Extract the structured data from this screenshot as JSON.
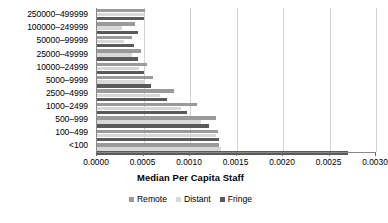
{
  "chart_data": {
    "type": "bar",
    "orientation": "horizontal",
    "title": "",
    "xlabel": "Median Per Capita Staff",
    "ylabel": "",
    "xlim": [
      0.0,
      0.003
    ],
    "xticks": [
      "0.0000",
      "0.0005",
      "0.0010",
      "0.0015",
      "0.0020",
      "0.0025",
      "0.0030"
    ],
    "xtick_values": [
      0.0,
      0.0005,
      0.001,
      0.0015,
      0.002,
      0.0025,
      0.003
    ],
    "grid": true,
    "grid_axis": "x",
    "legend_position": "bottom",
    "categories": [
      "250000–499999",
      "100000–249999",
      "50000–99999",
      "25000–49999",
      "10000–24999",
      "5000–9999",
      "2500–4999",
      "1000–2499",
      "500–999",
      "100–499",
      "<100"
    ],
    "series": [
      {
        "name": "Remote",
        "color": "#9a9a9a",
        "values": [
          0.00052,
          0.00041,
          0.00038,
          0.00047,
          0.00054,
          0.0006,
          0.00083,
          0.00108,
          0.00128,
          0.0013,
          0.00131
        ]
      },
      {
        "name": "Distant",
        "color": "#d8d8d8",
        "values": [
          0.0005,
          0.00027,
          0.00029,
          0.00038,
          0.00045,
          0.00052,
          0.00068,
          0.0009,
          0.00112,
          0.00128,
          0.00133
        ]
      },
      {
        "name": "Fringe",
        "color": "#5a5a5a",
        "values": [
          0.0005,
          0.00044,
          0.0004,
          0.00044,
          0.00051,
          0.00058,
          0.00075,
          0.00097,
          0.0012,
          0.00131,
          0.0027
        ]
      }
    ]
  },
  "legend": {
    "items": [
      {
        "label": "Remote",
        "key": "remote"
      },
      {
        "label": "Distant",
        "key": "distant"
      },
      {
        "label": "Fringe",
        "key": "fringe"
      }
    ]
  }
}
